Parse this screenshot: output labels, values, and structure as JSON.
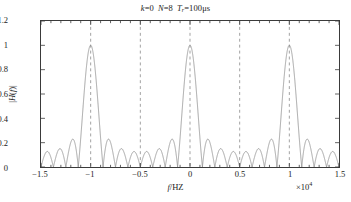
{
  "chart_data": {
    "type": "line",
    "title_parts": {
      "k_var": "k",
      "k_val": "=0",
      "n_var": "N",
      "n_val": "=8",
      "t_var": "T",
      "t_sub": "r",
      "t_val": "=100μs"
    },
    "xlabel": "f/HZ",
    "xlabel_italic": "f",
    "xlabel_rest": "/HZ",
    "ylabel": "|H(f)|",
    "ylabel_parts": {
      "pre": "|",
      "h": "H",
      "open": "(",
      "f": "f",
      "close": ")",
      "post": "|"
    },
    "x_multiplier": "×10⁴",
    "x_multiplier_base": "×10",
    "x_multiplier_exp": "4",
    "xlim": [
      -1.5,
      1.5
    ],
    "ylim": [
      0,
      1.2
    ],
    "xticks": [
      -1.5,
      -1,
      -0.5,
      0,
      0.5,
      1,
      1.5
    ],
    "xticklabels": [
      "−1.5",
      "−1",
      "−0.5",
      "0",
      "0.5",
      "1",
      "1.5"
    ],
    "yticks": [
      0,
      0.2,
      0.4,
      0.6,
      0.8,
      1,
      1.2
    ],
    "yticklabels": [
      "0",
      "0.2",
      "0.4",
      "0.6",
      "0.8",
      "1",
      "1.2"
    ],
    "x_minor_tick_count": 4,
    "grid": {
      "vertical_dashed_at": [
        -1,
        -0.5,
        0,
        0.5,
        1
      ],
      "horizontal": false
    },
    "legend": null,
    "series": [
      {
        "name": "|H(f)|",
        "color": "#8c8c8c",
        "linewidth": 0.8,
        "description": "Dirichlet-kernel magnitude response, N=8 coherent integration, main lobe at f=0 with peak 1.0, first null near ±1250 Hz, sidelobes decaying outward",
        "peak_value": 1.0,
        "peak_x": 0,
        "first_sidelobe_value": 0.22,
        "mainlobe_half_width": 1250,
        "null_spacing": 1250,
        "sidelobe_peaks_x": [
          -14375,
          -13125,
          -11875,
          -10625,
          -9375,
          -8125,
          -6875,
          -5625,
          -4375,
          -3125,
          -1875,
          1875,
          3125,
          4375,
          5625,
          6875,
          8125,
          9375,
          10625,
          11875,
          13125,
          14375
        ],
        "sidelobe_peaks_y": [
          0.027,
          0.029,
          0.031,
          0.034,
          0.038,
          0.043,
          0.05,
          0.06,
          0.075,
          0.1,
          0.22,
          0.22,
          0.1,
          0.075,
          0.06,
          0.05,
          0.043,
          0.038,
          0.034,
          0.031,
          0.029,
          0.027
        ]
      }
    ]
  },
  "style": {
    "axis_color": "#3a3a3a",
    "grid_color": "#7a7a7a",
    "curve_color": "#8c8c8c",
    "background": "#ffffff"
  }
}
